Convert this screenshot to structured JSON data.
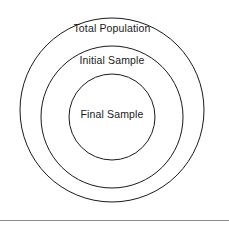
{
  "figure": {
    "type": "concentric-venn-diagram",
    "background_color": "#ffffff",
    "stroke_color": "#1a1a1a",
    "text_color": "#1a1a1a",
    "rule_color": "#8e8e8e"
  },
  "chart_data": {
    "type": "diagram",
    "title": "",
    "subtitle": "",
    "xlabel": "",
    "ylabel": "",
    "legend": [],
    "grid": false,
    "shape": "concentric-circles",
    "nesting_order": [
      "Total Population",
      "Initial Sample",
      "Final Sample"
    ],
    "rings": [
      {
        "label": "Total Population",
        "level": 1,
        "center_x": 112,
        "center_y": 110,
        "radius": 92,
        "label_x": 112,
        "label_y": 28,
        "fill": "none",
        "stroke": "#1a1a1a"
      },
      {
        "label": "Initial Sample",
        "level": 2,
        "center_x": 112,
        "center_y": 117,
        "radius": 71,
        "label_x": 112,
        "label_y": 60,
        "fill": "none",
        "stroke": "#1a1a1a"
      },
      {
        "label": "Final Sample",
        "level": 3,
        "center_x": 112,
        "center_y": 117,
        "radius": 43,
        "label_x": 112,
        "label_y": 114,
        "fill": "none",
        "stroke": "#1a1a1a"
      }
    ]
  },
  "labels": {
    "outer": "Total Population",
    "middle": "Initial Sample",
    "inner": "Final Sample"
  }
}
